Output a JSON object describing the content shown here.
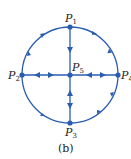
{
  "diagram": {
    "color": "#2a5db0",
    "nodes": [
      {
        "id": "P1",
        "label": "P",
        "sub": "1",
        "x": 70,
        "y": 27
      },
      {
        "id": "P2",
        "label": "P",
        "sub": "2",
        "x": 22,
        "y": 75
      },
      {
        "id": "P3",
        "label": "P",
        "sub": "3",
        "x": 70,
        "y": 123
      },
      {
        "id": "P4",
        "label": "P",
        "sub": "4",
        "x": 118,
        "y": 75
      },
      {
        "id": "P5",
        "label": "P",
        "sub": "5",
        "x": 70,
        "y": 75
      }
    ],
    "caption": "(b)"
  }
}
